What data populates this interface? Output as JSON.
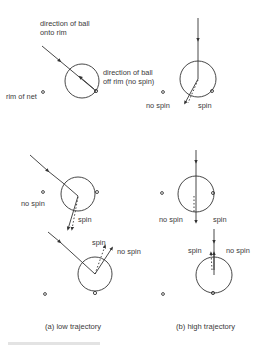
{
  "labels": {
    "direction_onto_rim_line1": "direction of ball",
    "direction_onto_rim_line2": "onto rim",
    "direction_off_rim_line1": "direction of ball",
    "direction_off_rim_line2": "off rim (no spin)",
    "rim_of_net": "rim of net",
    "b1_no_spin": "no spin",
    "b1_spin": "spin",
    "a2_no_spin": "no spin",
    "a2_spin": "spin",
    "b2_no_spin": "no spin",
    "b2_spin": "spin",
    "a3_spin": "spin",
    "a3_no_spin": "no spin",
    "b3_spin": "spin",
    "b3_no_spin": "no spin"
  },
  "captions": {
    "a": "(a) low trajectory",
    "b": "(b) high trajectory"
  },
  "colors": {
    "ink": "#333333",
    "background": "#ffffff"
  }
}
